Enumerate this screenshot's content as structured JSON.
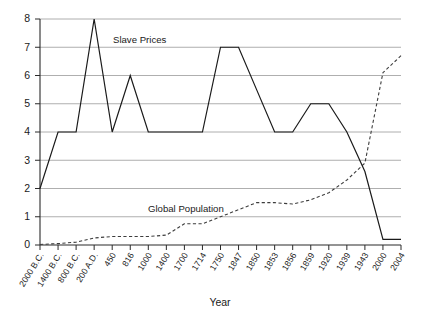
{
  "chart_data": {
    "type": "line",
    "title": "",
    "xlabel": "Year",
    "ylabel": "",
    "ylim": [
      0,
      8
    ],
    "yticks": [
      0,
      1,
      2,
      3,
      4,
      5,
      6,
      7,
      8
    ],
    "grid": true,
    "legend_position": "inline-annotations",
    "categories": [
      "2000 B.C.",
      "1400 B.C.",
      "800 B.C.",
      "200 A.D.",
      "450",
      "816",
      "1000",
      "1400",
      "1700",
      "1714",
      "1750",
      "1847",
      "1850",
      "1853",
      "1856",
      "1859",
      "1920",
      "1939",
      "1943",
      "2000",
      "2004"
    ],
    "series": [
      {
        "name": "Slave Prices",
        "style": "solid",
        "color": "#1a1a1a",
        "values": [
          2,
          4,
          4,
          8,
          4,
          6,
          4,
          4,
          4,
          4,
          7,
          7,
          5.5,
          4,
          4,
          5,
          5,
          4,
          2.6,
          0.2,
          0.2
        ]
      },
      {
        "name": "Global Population",
        "style": "dashed",
        "color": "#3d3d3d",
        "values": [
          0.02,
          0.05,
          0.1,
          0.25,
          0.3,
          0.3,
          0.3,
          0.35,
          0.75,
          0.75,
          1.0,
          1.25,
          1.5,
          1.5,
          1.45,
          1.6,
          1.85,
          2.3,
          2.9,
          6.1,
          6.7
        ]
      }
    ],
    "annotations": [
      {
        "text": "Slave Prices",
        "x_pixel": 113,
        "y_pixel": 43
      },
      {
        "text": "Global Population",
        "x_pixel": 148,
        "y_pixel": 212
      }
    ]
  },
  "axis": {
    "x_title": "Year",
    "y_tick_labels": [
      "0",
      "1",
      "2",
      "3",
      "4",
      "5",
      "6",
      "7",
      "8"
    ]
  }
}
